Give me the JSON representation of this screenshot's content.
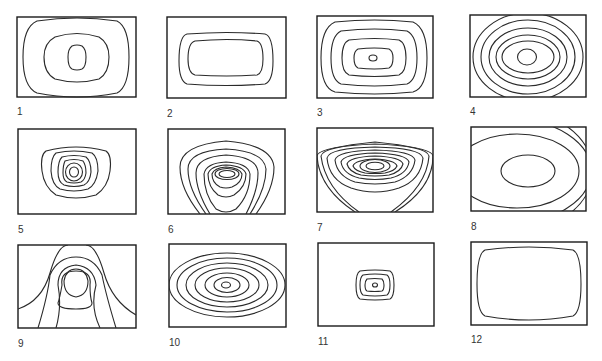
{
  "figure": {
    "panels": [
      {
        "id": 1,
        "label": "1",
        "description": "Three nested rounded contours centered in frame"
      },
      {
        "id": 2,
        "label": "2",
        "description": "Two nested rounded rectangles, wide"
      },
      {
        "id": 3,
        "label": "3",
        "description": "Four nested rounded squares with small central ellipse"
      },
      {
        "id": 4,
        "label": "4",
        "description": "Concentric ellipses extending beyond frame top and bottom"
      },
      {
        "id": 5,
        "label": "5",
        "description": "Six nested rounded contours concentrated at center"
      },
      {
        "id": 6,
        "label": "6",
        "description": "Inverted-dome contours opening at bottom edge with central ellipses"
      },
      {
        "id": 7,
        "label": "7",
        "description": "Bowl-shaped nested contours with central ellipse"
      },
      {
        "id": 8,
        "label": "8",
        "description": "Large ellipses cut off by right edge with one central ellipse"
      },
      {
        "id": 9,
        "label": "9",
        "description": "Bell-shaped contours rising from bottom with inner head shape"
      },
      {
        "id": 10,
        "label": "10",
        "description": "Seven concentric ellipses"
      },
      {
        "id": 11,
        "label": "11",
        "description": "Small nested rounded rectangles at center"
      },
      {
        "id": 12,
        "label": "12",
        "description": "Single large rounded-square contour"
      }
    ]
  }
}
